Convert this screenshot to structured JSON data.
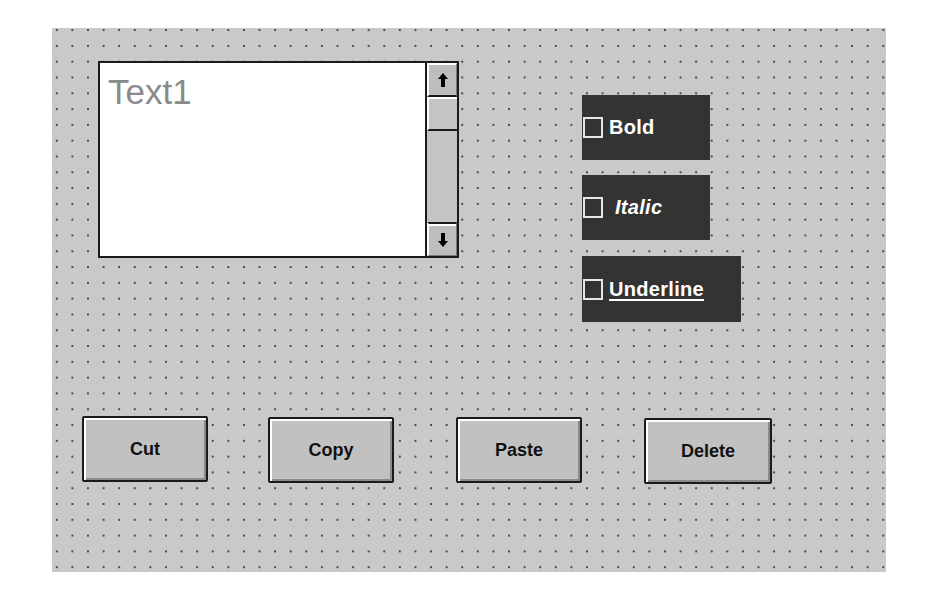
{
  "form": {
    "background_color": "#c9c9c9",
    "grid_dot_color": "#4a4a4a"
  },
  "textbox": {
    "value": "Text1",
    "text_color": "#8a8a8a",
    "scrollbar": {
      "up_icon": "arrow-up-icon",
      "down_icon": "arrow-down-icon"
    }
  },
  "checkboxes": [
    {
      "label": "Bold",
      "checked": false,
      "style": "bold"
    },
    {
      "label": "Italic",
      "checked": false,
      "style": "italic"
    },
    {
      "label": "Underline",
      "checked": false,
      "style": "underline"
    }
  ],
  "checkbox_background": "#333333",
  "buttons": [
    {
      "label": "Cut"
    },
    {
      "label": "Copy"
    },
    {
      "label": "Paste"
    },
    {
      "label": "Delete"
    }
  ]
}
